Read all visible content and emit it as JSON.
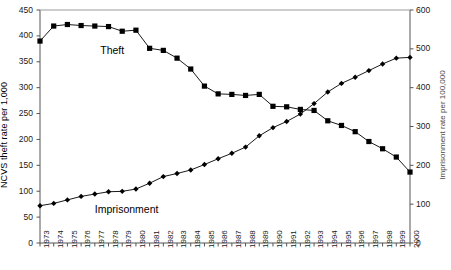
{
  "chart_data": {
    "type": "line",
    "title": "",
    "xlabel": "",
    "ylabel": "NCVS theft rate per 1,000",
    "ylabel_right": "Imprisonment rate per 100,000",
    "ylim": [
      0,
      450
    ],
    "ylim_right": [
      0,
      600
    ],
    "ytick_step": 50,
    "ytick_step_right": 100,
    "grid": false,
    "legend_position": "inline-annotation",
    "x": [
      1973,
      1974,
      1975,
      1976,
      1977,
      1978,
      1979,
      1980,
      1981,
      1982,
      1983,
      1984,
      1985,
      1986,
      1987,
      1988,
      1989,
      1990,
      1991,
      1992,
      1993,
      1994,
      1995,
      1996,
      1997,
      1998,
      1999,
      2000
    ],
    "xtick_labels": [
      "1973",
      "1974",
      "1975",
      "1976",
      "1977",
      "1978",
      "1979",
      "1980",
      "1981",
      "1982",
      "1983",
      "1984",
      "1985",
      "1986",
      "1987",
      "1988",
      "1989",
      "1990",
      "1991",
      "1992",
      "1993",
      "1994",
      "1995",
      "1996",
      "1997",
      "1998",
      "1999",
      "2000"
    ],
    "ytick_labels_left": [
      "0",
      "50",
      "100",
      "150",
      "200",
      "250",
      "300",
      "350",
      "400",
      "450"
    ],
    "ytick_labels_right": [
      "0",
      "100",
      "200",
      "300",
      "400",
      "500",
      "600"
    ],
    "series": [
      {
        "name": "Theft",
        "axis": "left",
        "marker": "square",
        "color": "#000000",
        "label_x": 1977.4,
        "label_y": 372,
        "values": [
          390,
          419,
          422,
          420,
          419,
          418,
          409,
          411,
          376,
          372,
          357,
          336,
          303,
          288,
          287,
          285,
          287,
          264,
          263,
          258,
          256,
          236,
          227,
          215,
          196,
          182,
          166,
          137
        ]
      },
      {
        "name": "Imprisonment",
        "axis": "right",
        "marker": "diamond",
        "color": "#000000",
        "label_x": 1977.0,
        "label_y": 88,
        "values": [
          96,
          102,
          111,
          120,
          126,
          132,
          133,
          139,
          154,
          171,
          179,
          188,
          202,
          217,
          231,
          247,
          276,
          297,
          313,
          332,
          359,
          389,
          411,
          427,
          444,
          461,
          476,
          478
        ]
      }
    ]
  }
}
